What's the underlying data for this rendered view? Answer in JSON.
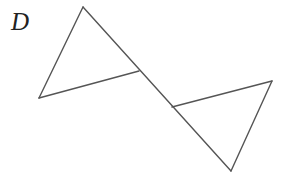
{
  "figure": {
    "label": "D",
    "stroke_color": "#555555",
    "points": {
      "top": [
        83,
        7
      ],
      "bottom_left": [
        39,
        98
      ],
      "intersection_upper": [
        139,
        71
      ],
      "intersection_lower": [
        172,
        107
      ],
      "right": [
        272,
        81
      ],
      "bottom": [
        231,
        171
      ]
    },
    "segments": [
      {
        "name": "upper-triangle-left-side",
        "from": "top",
        "to": "bottom_left"
      },
      {
        "name": "upper-triangle-base",
        "from": "bottom_left",
        "to": "intersection_upper"
      },
      {
        "name": "transversal-line",
        "from": "top",
        "to": "bottom"
      },
      {
        "name": "lower-triangle-top-side",
        "from": "intersection_lower",
        "to": "right"
      },
      {
        "name": "lower-triangle-right-side",
        "from": "right",
        "to": "bottom"
      }
    ]
  }
}
